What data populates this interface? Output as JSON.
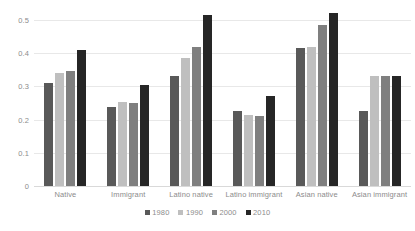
{
  "chart_data": {
    "type": "bar",
    "title": "",
    "subtitle": "",
    "xlabel": "",
    "ylabel": "",
    "ylim": [
      0,
      0.5
    ],
    "yticks": [
      "0",
      "0.1",
      "0.2",
      "0.3",
      "0.4",
      "0.5"
    ],
    "ytick_values": [
      0,
      0.1,
      0.2,
      0.3,
      0.4,
      0.5
    ],
    "grid": true,
    "legend_position": "bottom",
    "categories": [
      "Native",
      "Immigrant",
      "Latino native",
      "Latino immigrant",
      "Asian native",
      "Asian immigrant"
    ],
    "series": [
      {
        "name": "1980",
        "color": "#595959",
        "values": [
          0.31,
          0.237,
          0.33,
          0.225,
          0.415,
          0.225
        ]
      },
      {
        "name": "1990",
        "color": "#bfbfbf",
        "values": [
          0.34,
          0.253,
          0.385,
          0.213,
          0.42,
          0.33
        ]
      },
      {
        "name": "2000",
        "color": "#7f7f7f",
        "values": [
          0.345,
          0.25,
          0.42,
          0.212,
          0.485,
          0.33
        ]
      },
      {
        "name": "2010",
        "color": "#262626",
        "values": [
          0.41,
          0.303,
          0.515,
          0.27,
          0.52,
          0.33
        ]
      }
    ]
  },
  "colors": {
    "gridline": "#e8e8e8",
    "baseline": "#d9d9d9",
    "axis_text": "#8c8c8c",
    "background": "#ffffff"
  }
}
